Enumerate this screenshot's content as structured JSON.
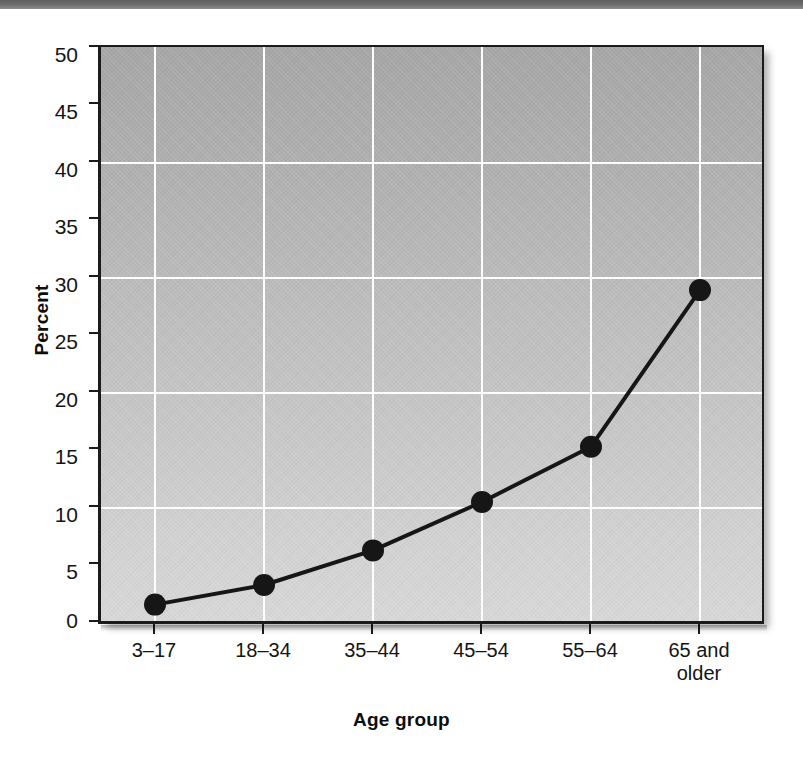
{
  "figure": {
    "background_color": "#ffffff",
    "top_band_color": "#6e6e6e",
    "plot_fill_top": "#a6a6a6",
    "plot_fill_bottom": "#d8d8d8",
    "gridline_color": "#fdfdfd",
    "axis_color": "#1b1b1b",
    "series_color": "#161616"
  },
  "chart_data": {
    "type": "line",
    "title": "",
    "xlabel": "Age group",
    "ylabel": "Percent",
    "categories": [
      "3–17",
      "18–34",
      "35–44",
      "45–54",
      "55–64",
      "65 and older"
    ],
    "category_lines": [
      [
        "3–17"
      ],
      [
        "18–34"
      ],
      [
        "35–44"
      ],
      [
        "45–54"
      ],
      [
        "55–64"
      ],
      [
        "65 and",
        "older"
      ]
    ],
    "values": [
      1.6,
      3.3,
      6.3,
      10.5,
      15.3,
      28.9
    ],
    "series": [
      {
        "name": "Percent",
        "values": [
          1.6,
          3.3,
          6.3,
          10.5,
          15.3,
          28.9
        ]
      }
    ],
    "ylim": [
      0,
      50
    ],
    "y_ticks": [
      0,
      5,
      10,
      15,
      20,
      25,
      30,
      35,
      40,
      45,
      50
    ],
    "y_tick_labels": [
      "0",
      "5",
      "10",
      "15",
      "20",
      "25",
      "30",
      "35",
      "40",
      "45",
      "50"
    ],
    "gridlines_y": [
      10,
      20,
      30,
      40
    ],
    "grid": "major-horizontal-and-category-verticals",
    "legend": "none",
    "marker": "filled-circle",
    "marker_color": "#161616",
    "line_width_px": 4
  }
}
